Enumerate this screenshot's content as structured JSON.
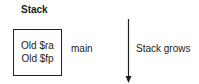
{
  "diagram": {
    "title": "Stack",
    "frame": {
      "name": "main",
      "entries": [
        "Old $ra",
        "Old $fp"
      ]
    },
    "arrow": {
      "direction": "down",
      "label": "Stack grows"
    }
  },
  "colors": {
    "stroke": "#222222",
    "background": "#ffffff"
  }
}
